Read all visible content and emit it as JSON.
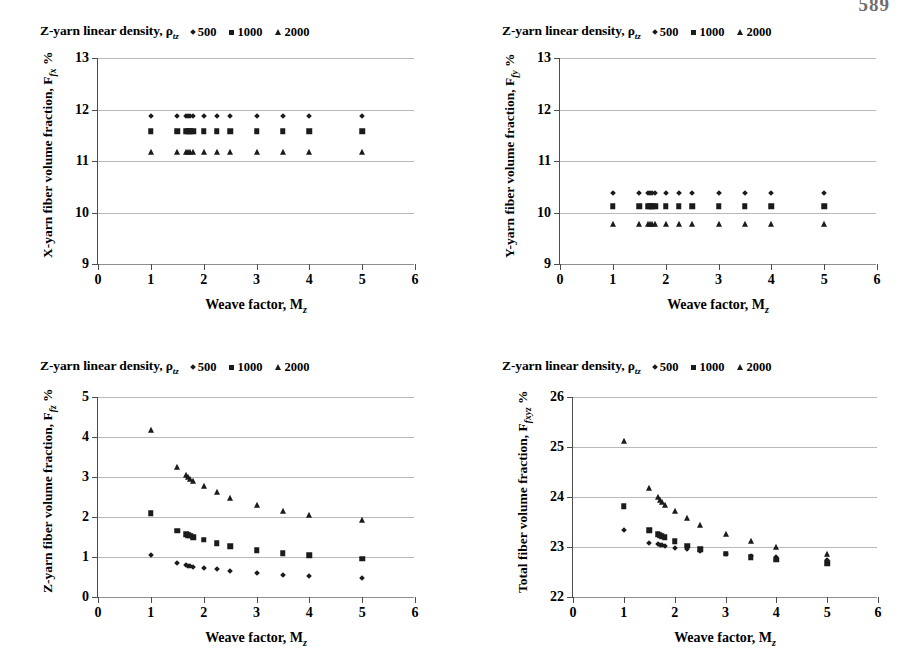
{
  "page": {
    "number": "589"
  },
  "legend": {
    "title": "Z-yarn linear density, ρ",
    "title_sub": "tz",
    "entries": [
      {
        "label": "500",
        "marker": "diamond-marker-icon"
      },
      {
        "label": "1000",
        "marker": "square-marker-icon"
      },
      {
        "label": "2000",
        "marker": "triangle-marker-icon"
      }
    ]
  },
  "axis": {
    "x_title": "Weave factor, M",
    "x_title_sub": "z",
    "x_ticks": [
      "0",
      "1",
      "2",
      "3",
      "4",
      "5",
      "6"
    ],
    "x_range": [
      0,
      6
    ]
  },
  "chart_data": [
    {
      "id": "chart-x-yarn",
      "type": "scatter",
      "title": "Z-yarn linear density, ρtz",
      "xlabel": "Weave factor, Mz",
      "ylabel": "X-yarn fiber volume fraction, Ffx %",
      "ylabel_main": "X-yarn fiber volume fraction, F",
      "ylabel_sub": "fx",
      "ylabel_suffix": " %",
      "xlim": [
        0,
        6
      ],
      "ylim": [
        9,
        13
      ],
      "yticks": [
        "9",
        "10",
        "11",
        "12",
        "13"
      ],
      "grid": true,
      "legend_position": "top",
      "series": [
        {
          "name": "500",
          "marker": "diamond",
          "x": [
            1.0,
            1.5,
            1.67,
            1.71,
            1.75,
            1.8,
            2.0,
            2.25,
            2.5,
            3.0,
            3.5,
            4.0,
            5.0
          ],
          "y": [
            11.87,
            11.87,
            11.87,
            11.87,
            11.87,
            11.87,
            11.87,
            11.87,
            11.87,
            11.87,
            11.87,
            11.87,
            11.87
          ]
        },
        {
          "name": "1000",
          "marker": "square",
          "x": [
            1.0,
            1.5,
            1.67,
            1.71,
            1.75,
            1.8,
            2.0,
            2.25,
            2.5,
            3.0,
            3.5,
            4.0,
            5.0
          ],
          "y": [
            11.58,
            11.58,
            11.58,
            11.58,
            11.58,
            11.58,
            11.58,
            11.58,
            11.58,
            11.58,
            11.58,
            11.58,
            11.58
          ]
        },
        {
          "name": "2000",
          "marker": "triangle",
          "x": [
            1.0,
            1.5,
            1.67,
            1.71,
            1.75,
            1.8,
            2.0,
            2.25,
            2.5,
            3.0,
            3.5,
            4.0,
            5.0
          ],
          "y": [
            11.17,
            11.17,
            11.17,
            11.17,
            11.17,
            11.17,
            11.17,
            11.17,
            11.17,
            11.17,
            11.17,
            11.17,
            11.17
          ]
        }
      ]
    },
    {
      "id": "chart-y-yarn",
      "type": "scatter",
      "title": "Z-yarn linear density, ρtz",
      "xlabel": "Weave factor, Mz",
      "ylabel": "Y-yarn fiber volume fraction, Ffy %",
      "ylabel_main": "Y-yarn fiber volume fraction, F",
      "ylabel_sub": "fy",
      "ylabel_suffix": " %",
      "xlim": [
        0,
        6
      ],
      "ylim": [
        9,
        13
      ],
      "yticks": [
        "9",
        "10",
        "11",
        "12",
        "13"
      ],
      "grid": true,
      "legend_position": "top",
      "series": [
        {
          "name": "500",
          "marker": "diamond",
          "x": [
            1.0,
            1.5,
            1.67,
            1.71,
            1.75,
            1.8,
            2.0,
            2.25,
            2.5,
            3.0,
            3.5,
            4.0,
            5.0
          ],
          "y": [
            10.38,
            10.38,
            10.38,
            10.38,
            10.38,
            10.38,
            10.38,
            10.38,
            10.38,
            10.38,
            10.38,
            10.38,
            10.38
          ]
        },
        {
          "name": "1000",
          "marker": "square",
          "x": [
            1.0,
            1.5,
            1.67,
            1.71,
            1.75,
            1.8,
            2.0,
            2.25,
            2.5,
            3.0,
            3.5,
            4.0,
            5.0
          ],
          "y": [
            10.12,
            10.12,
            10.12,
            10.12,
            10.12,
            10.12,
            10.12,
            10.12,
            10.12,
            10.12,
            10.12,
            10.12,
            10.12
          ]
        },
        {
          "name": "2000",
          "marker": "triangle",
          "x": [
            1.0,
            1.5,
            1.67,
            1.71,
            1.75,
            1.8,
            2.0,
            2.25,
            2.5,
            3.0,
            3.5,
            4.0,
            5.0
          ],
          "y": [
            9.77,
            9.77,
            9.77,
            9.77,
            9.77,
            9.77,
            9.77,
            9.77,
            9.77,
            9.77,
            9.77,
            9.77,
            9.77
          ]
        }
      ]
    },
    {
      "id": "chart-z-yarn",
      "type": "scatter",
      "title": "Z-yarn linear density, ρtz",
      "xlabel": "Weave factor, Mz",
      "ylabel": "Z-yarn fiber volume fraction, Ffz %",
      "ylabel_main": "Z-yarn fiber volume fraction, F",
      "ylabel_sub": "fz",
      "ylabel_suffix": " %",
      "xlim": [
        0,
        6
      ],
      "ylim": [
        0,
        5
      ],
      "yticks": [
        "0",
        "1",
        "2",
        "3",
        "4",
        "5"
      ],
      "grid": true,
      "legend_position": "top",
      "series": [
        {
          "name": "500",
          "marker": "diamond",
          "x": [
            1.0,
            1.5,
            1.67,
            1.71,
            1.75,
            1.8,
            2.0,
            2.25,
            2.5,
            3.0,
            3.5,
            4.0,
            5.0
          ],
          "y": [
            1.06,
            0.84,
            0.79,
            0.78,
            0.77,
            0.76,
            0.72,
            0.69,
            0.66,
            0.59,
            0.55,
            0.53,
            0.47
          ]
        },
        {
          "name": "1000",
          "marker": "square",
          "x": [
            1.0,
            1.5,
            1.67,
            1.71,
            1.75,
            1.8,
            2.0,
            2.25,
            2.5,
            3.0,
            3.5,
            4.0,
            5.0
          ],
          "y": [
            2.1,
            1.66,
            1.57,
            1.55,
            1.53,
            1.5,
            1.43,
            1.34,
            1.27,
            1.17,
            1.09,
            1.04,
            0.96
          ]
        },
        {
          "name": "2000",
          "marker": "triangle",
          "x": [
            1.0,
            1.5,
            1.67,
            1.71,
            1.75,
            1.8,
            2.0,
            2.25,
            2.5,
            3.0,
            3.5,
            4.0,
            5.0
          ],
          "y": [
            4.18,
            3.25,
            3.05,
            3.0,
            2.96,
            2.9,
            2.78,
            2.62,
            2.48,
            2.29,
            2.15,
            2.05,
            1.92
          ]
        }
      ]
    },
    {
      "id": "chart-total",
      "type": "scatter",
      "title": "Z-yarn linear density, ρtz",
      "xlabel": "Weave factor, Mz",
      "ylabel": "Total fiber volume fraction, Ffxyz %",
      "ylabel_main": "Total fiber volume fraction, F",
      "ylabel_sub": "fxyz",
      "ylabel_suffix": " %",
      "xlim": [
        0,
        6
      ],
      "ylim": [
        22,
        26
      ],
      "yticks": [
        "22",
        "23",
        "24",
        "25",
        "26"
      ],
      "grid": true,
      "legend_position": "top",
      "series": [
        {
          "name": "500",
          "marker": "diamond",
          "x": [
            1.0,
            1.5,
            1.67,
            1.71,
            1.75,
            1.8,
            2.0,
            2.25,
            2.5,
            3.0,
            3.5,
            4.0,
            5.0
          ],
          "y": [
            23.35,
            23.09,
            23.06,
            23.05,
            23.04,
            23.03,
            22.99,
            22.96,
            22.93,
            22.86,
            22.82,
            22.8,
            22.74
          ]
        },
        {
          "name": "1000",
          "marker": "square",
          "x": [
            1.0,
            1.5,
            1.67,
            1.71,
            1.75,
            1.8,
            2.0,
            2.25,
            2.5,
            3.0,
            3.5,
            4.0,
            5.0
          ],
          "y": [
            23.82,
            23.34,
            23.26,
            23.24,
            23.22,
            23.2,
            23.12,
            23.03,
            22.96,
            22.87,
            22.8,
            22.75,
            22.68
          ]
        },
        {
          "name": "2000",
          "marker": "triangle",
          "x": [
            1.0,
            1.5,
            1.67,
            1.71,
            1.75,
            1.8,
            2.0,
            2.25,
            2.5,
            3.0,
            3.5,
            4.0,
            5.0
          ],
          "y": [
            25.12,
            24.18,
            24.0,
            23.95,
            23.9,
            23.85,
            23.73,
            23.58,
            23.44,
            23.26,
            23.12,
            23.0,
            22.86
          ]
        }
      ]
    }
  ]
}
